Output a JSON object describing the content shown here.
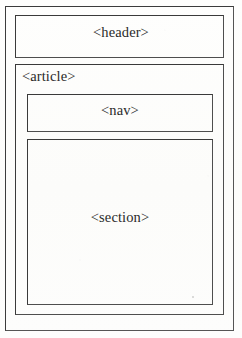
{
  "diagram": {
    "type": "nested-box-layout",
    "style": {
      "background_color": "#fdfdfc",
      "line_color": "#3a3a3a",
      "text_color": "#2a2a2a"
    },
    "outer_frame": {
      "label": "",
      "note": "page border"
    },
    "boxes": [
      {
        "tag": "header",
        "label": "<header>",
        "label_align": "center",
        "parent": "outer_frame",
        "children": []
      },
      {
        "tag": "article",
        "label": "<article>",
        "label_align": "left",
        "parent": "outer_frame",
        "children": [
          "nav",
          "section"
        ]
      },
      {
        "tag": "nav",
        "label": "<nav>",
        "label_align": "center",
        "parent": "article",
        "children": []
      },
      {
        "tag": "section",
        "label": "<section>",
        "label_align": "center",
        "parent": "article",
        "children": []
      }
    ]
  }
}
